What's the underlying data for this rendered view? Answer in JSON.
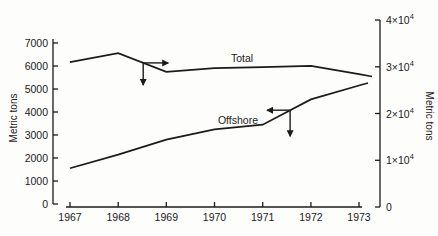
{
  "figure": {
    "background": "#fdfdfc",
    "ink": "#1b1b1b"
  },
  "chart_data": {
    "type": "line",
    "x": [
      1967,
      1968,
      1969,
      1970,
      1971,
      1972,
      1973
    ],
    "x_tick_labels": [
      "1967",
      "1968",
      "1969",
      "1970",
      "1971",
      "1972",
      "1973"
    ],
    "left_axis": {
      "label": "Metric tons",
      "range": [
        0,
        7000
      ],
      "ticks": [
        {
          "value": 0,
          "label": "0"
        },
        {
          "value": 1000,
          "label": "1000"
        },
        {
          "value": 2000,
          "label": "2000"
        },
        {
          "value": 3000,
          "label": "3000"
        },
        {
          "value": 4000,
          "label": "4000"
        },
        {
          "value": 5000,
          "label": "5000"
        },
        {
          "value": 6000,
          "label": "6000"
        },
        {
          "value": 7000,
          "label": "7000"
        }
      ]
    },
    "right_axis": {
      "label": "Metric tons",
      "range": [
        0,
        40000
      ],
      "ticks": [
        {
          "value": 0,
          "label": "0"
        },
        {
          "value": 10000,
          "label": "1×10^4"
        },
        {
          "value": 20000,
          "label": "2×10^4"
        },
        {
          "value": 30000,
          "label": "3×10^4"
        },
        {
          "value": 40000,
          "label": "4×10^4"
        }
      ]
    },
    "series": [
      {
        "name": "Total",
        "axis": "right",
        "values": [
          31000,
          32900,
          28900,
          29700,
          29900,
          30200,
          28400
        ]
      },
      {
        "name": "Offshore",
        "axis": "left",
        "values": [
          1550,
          2150,
          2800,
          3250,
          3450,
          4550,
          5150
        ]
      }
    ],
    "annotations": [
      {
        "series": "Total",
        "year": 1968.52,
        "horizontal_arrow": "right",
        "h_len": 25,
        "vertical_arrow": "down",
        "v_len": 22
      },
      {
        "series": "Offshore",
        "year": 1971.57,
        "horizontal_arrow": "left",
        "h_len": 23,
        "vertical_arrow": "down",
        "v_len": 26
      }
    ],
    "grid": false,
    "legend": "inline-labels"
  }
}
